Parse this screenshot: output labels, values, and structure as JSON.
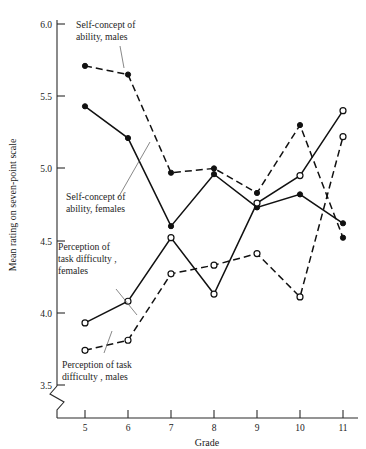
{
  "chart_data": {
    "type": "line",
    "title": "",
    "xlabel": "Grade",
    "ylabel": "Mean rating on seven-point scale",
    "x": [
      5,
      6,
      7,
      8,
      9,
      10,
      11
    ],
    "categories": [
      "5",
      "6",
      "7",
      "8",
      "9",
      "10",
      "11"
    ],
    "xtick_labels": [
      "5",
      "6",
      "7",
      "8",
      "9",
      "10",
      "11"
    ],
    "ytick_labels": [
      "3.5",
      "4.0",
      "4.5",
      "5.0",
      "5.5",
      "6.0"
    ],
    "yticks": [
      3.5,
      4.0,
      4.5,
      5.0,
      5.5,
      6.0
    ],
    "xlim": [
      4.5,
      11.3
    ],
    "ylim": [
      3.4,
      6.0
    ],
    "grid": false,
    "legend": "annotations-on-plot",
    "axis_break": true,
    "axis_break_note": "zigzag break on y-axis below 3.5",
    "series": [
      {
        "name": "Self-concept of ability, males",
        "marker": "filled-circle",
        "line": "dashed",
        "values": [
          5.71,
          5.65,
          4.97,
          5.0,
          4.83,
          5.3,
          4.52
        ]
      },
      {
        "name": "Self-concept of ability, females",
        "marker": "filled-circle",
        "line": "solid",
        "values": [
          5.43,
          5.21,
          4.6,
          4.96,
          4.73,
          4.82,
          4.62
        ]
      },
      {
        "name": "Perception of task difficulty, females",
        "marker": "open-circle",
        "line": "solid",
        "values": [
          3.93,
          4.08,
          4.52,
          4.13,
          4.76,
          4.95,
          5.4
        ]
      },
      {
        "name": "Perception of task difficulty, males",
        "marker": "open-circle",
        "line": "dashed",
        "values": [
          3.74,
          3.81,
          4.27,
          4.33,
          4.41,
          4.11,
          5.22
        ]
      }
    ],
    "annotations": [
      {
        "id": "a1",
        "text_line1": "Self-concept of",
        "text_line2": "ability, males"
      },
      {
        "id": "a2",
        "text_line1": "Self-concept of",
        "text_line2": "ability, females"
      },
      {
        "id": "a3",
        "text_line1": "Perception of",
        "text_line2": "task difficulty ,",
        "text_line3": "females"
      },
      {
        "id": "a4",
        "text_line1": "Perception of task",
        "text_line2": "difficulty , males"
      }
    ],
    "colors": {
      "ink": "#111111",
      "background": "#ffffff"
    }
  }
}
